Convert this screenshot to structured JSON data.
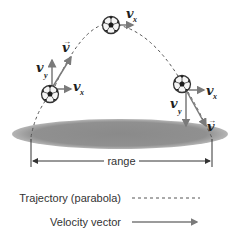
{
  "diagram": {
    "colors": {
      "trajectory": "#555555",
      "vector": "#7a7a7a",
      "ground": "#8e8e8e",
      "ball_dark": "#222222",
      "ball_light": "#f2f2f2",
      "text": "#333333"
    },
    "labels": {
      "v_symbol": "v",
      "v_arrow": "→",
      "x_sub": "x",
      "y_sub": "y",
      "range": "range"
    },
    "balls": [
      {
        "name": "launch",
        "position": "left",
        "components": [
          "v",
          "vx",
          "vy"
        ],
        "vy_direction": "up"
      },
      {
        "name": "apex",
        "position": "top",
        "components": [
          "vx"
        ]
      },
      {
        "name": "descent",
        "position": "right",
        "components": [
          "v",
          "vx",
          "vy"
        ],
        "vy_direction": "down"
      }
    ]
  },
  "legend": {
    "items": [
      {
        "label": "Trajectory (parabola)",
        "style": "dashed line"
      },
      {
        "label": "Velocity vector",
        "style": "arrow"
      }
    ]
  }
}
